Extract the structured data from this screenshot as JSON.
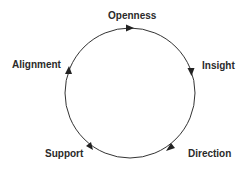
{
  "diagram": {
    "type": "cycle",
    "nodes": [
      {
        "label": "Openness"
      },
      {
        "label": "Insight"
      },
      {
        "label": "Direction"
      },
      {
        "label": "Support"
      },
      {
        "label": "Alignment"
      }
    ],
    "direction": "clockwise",
    "colors": {
      "line": "#333333",
      "text": "#2a2a2a"
    }
  }
}
